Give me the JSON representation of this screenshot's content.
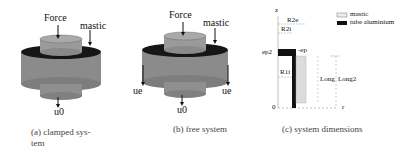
{
  "panels": [
    {
      "id": "a",
      "labels": {
        "force": "Force",
        "mastic": "mastic",
        "u0": "u0"
      },
      "caption_line1": "(a) clamped sys-",
      "caption_line2": "tem"
    },
    {
      "id": "b",
      "labels": {
        "force": "Force",
        "mastic": "mastic",
        "u0": "u0",
        "ue_left": "ue",
        "ue_right": "ue"
      },
      "caption": "(b) free system"
    },
    {
      "id": "c",
      "labels": {
        "z_axis": "z",
        "r_axis": "r",
        "origin": "0",
        "r2e": "R2e",
        "r2i": "R2i",
        "r1i": "R1i",
        "ep2": "ep2",
        "ep": "-ep",
        "long": "Long",
        "long2": "Long2"
      },
      "legend": [
        {
          "label": "mastic",
          "swatch": "#ececec"
        },
        {
          "label": "tube aluminium",
          "swatch": "#111111"
        }
      ],
      "caption": "(c) system dimensions"
    }
  ],
  "colors": {
    "cylinder": "#8e8e8e",
    "cylinder_dark": "#6f6f6f",
    "top": "#a8a8a8",
    "mastic": "#151515"
  }
}
